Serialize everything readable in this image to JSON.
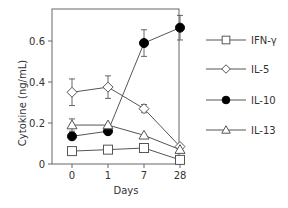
{
  "chart_data": {
    "type": "line",
    "title": "",
    "xlabel": "Days",
    "ylabel": "Cytokine (ng/mL)",
    "categories": [
      "0",
      "1",
      "7",
      "28"
    ],
    "ylim": [
      0,
      0.7
    ],
    "yticks": [
      0,
      0.2,
      0.4,
      0.6
    ],
    "ytick_labels": [
      "0",
      "0.2",
      "0.4",
      "0.6"
    ],
    "grid": false,
    "legend_position": "right",
    "series": [
      {
        "name": "IFN-γ",
        "marker": "square-open",
        "values": [
          0.063,
          0.07,
          0.078,
          0.02
        ],
        "errors": [
          0,
          0,
          0,
          0
        ]
      },
      {
        "name": "IL-5",
        "marker": "diamond-open",
        "values": [
          0.35,
          0.375,
          0.27,
          0.085
        ],
        "errors": [
          0.065,
          0.055,
          0.02,
          0.01
        ]
      },
      {
        "name": "IL-10",
        "marker": "circle-filled",
        "values": [
          0.135,
          0.16,
          0.59,
          0.665
        ],
        "errors": [
          0,
          0,
          0.065,
          0.06
        ]
      },
      {
        "name": "IL-13",
        "marker": "triangle-open",
        "values": [
          0.19,
          0.19,
          0.14,
          0.07
        ],
        "errors": [
          0.03,
          0,
          0,
          0
        ]
      }
    ]
  },
  "axes": {
    "xlabel": "Days",
    "ylabel": "Cytokine (ng/mL)"
  },
  "legend": [
    {
      "label": "IFN-γ",
      "marker": "square-open"
    },
    {
      "label": "IL-5",
      "marker": "diamond-open"
    },
    {
      "label": "IL-10",
      "marker": "circle-filled"
    },
    {
      "label": "IL-13",
      "marker": "triangle-open"
    }
  ],
  "colors": {
    "line": "#555555",
    "marker_fill_open": "#ffffff",
    "marker_fill_solid": "#000000",
    "text": "#333333"
  }
}
